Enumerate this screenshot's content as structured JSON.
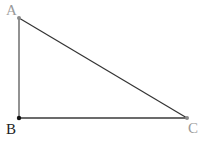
{
  "diagram": {
    "type": "triangle",
    "vertices": [
      {
        "id": "A",
        "label": "A",
        "x": 19,
        "y": 18,
        "label_x": 6,
        "label_y": 15,
        "point_color": "#8a8a8a",
        "label_color": "#9a9a9a"
      },
      {
        "id": "B",
        "label": "B",
        "x": 19,
        "y": 118,
        "label_x": 6,
        "label_y": 134,
        "point_color": "#111111",
        "label_color": "#222222"
      },
      {
        "id": "C",
        "label": "C",
        "x": 187,
        "y": 118,
        "label_x": 188,
        "label_y": 133,
        "point_color": "#8a8a8a",
        "label_color": "#9a9a9a"
      }
    ],
    "edges": [
      {
        "from": "A",
        "to": "B",
        "color": "#6e6e6e",
        "width": 1.5
      },
      {
        "from": "A",
        "to": "C",
        "color": "#333333",
        "width": 1.2
      },
      {
        "from": "B",
        "to": "C",
        "color": "#3a3a3a",
        "width": 1.5
      }
    ]
  }
}
